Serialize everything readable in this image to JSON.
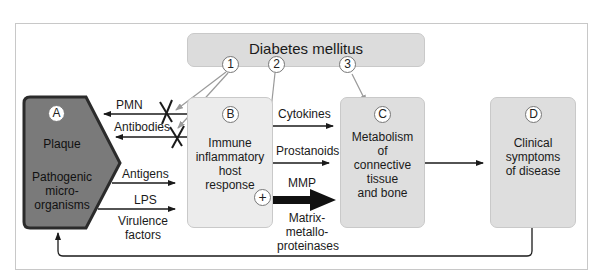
{
  "diagram": {
    "top_factor": {
      "label": "Diabetes mellitus",
      "markers": [
        "1",
        "2",
        "3"
      ]
    },
    "nodes": {
      "A": {
        "marker": "A",
        "title": "Plaque",
        "subtitle": "Pathogenic micro- organisms",
        "lines": [
          "Pathogenic",
          "micro-",
          "organisms"
        ]
      },
      "B": {
        "marker": "B",
        "lines": [
          "Immune",
          "inflammatory",
          "host",
          "response"
        ],
        "plus": "+"
      },
      "C": {
        "marker": "C",
        "lines": [
          "Metabolism",
          "of",
          "connective",
          "tissue",
          "and bone"
        ]
      },
      "D": {
        "marker": "D",
        "lines": [
          "Clinical",
          "symptoms",
          "of disease"
        ]
      }
    },
    "edges_b_to_a": [
      "PMN",
      "Antibodies"
    ],
    "edges_a_to_b": [
      "Antigens",
      "LPS",
      "Virulence factors"
    ],
    "virulence_lines": [
      "Virulence",
      "factors"
    ],
    "edges_b_to_c": [
      "Cytokines",
      "Prostanoids",
      "MMP"
    ],
    "mmp_full_lines": [
      "Matrix-",
      "metallo-",
      "proteinases"
    ]
  },
  "colors": {
    "plaque_fill": "#7a7a7a",
    "plaque_border": "#2b2b2b",
    "box_fill": "#dedede",
    "arrow": "#1a1a1a",
    "diabetes_arrow": "#9a9a9a"
  }
}
